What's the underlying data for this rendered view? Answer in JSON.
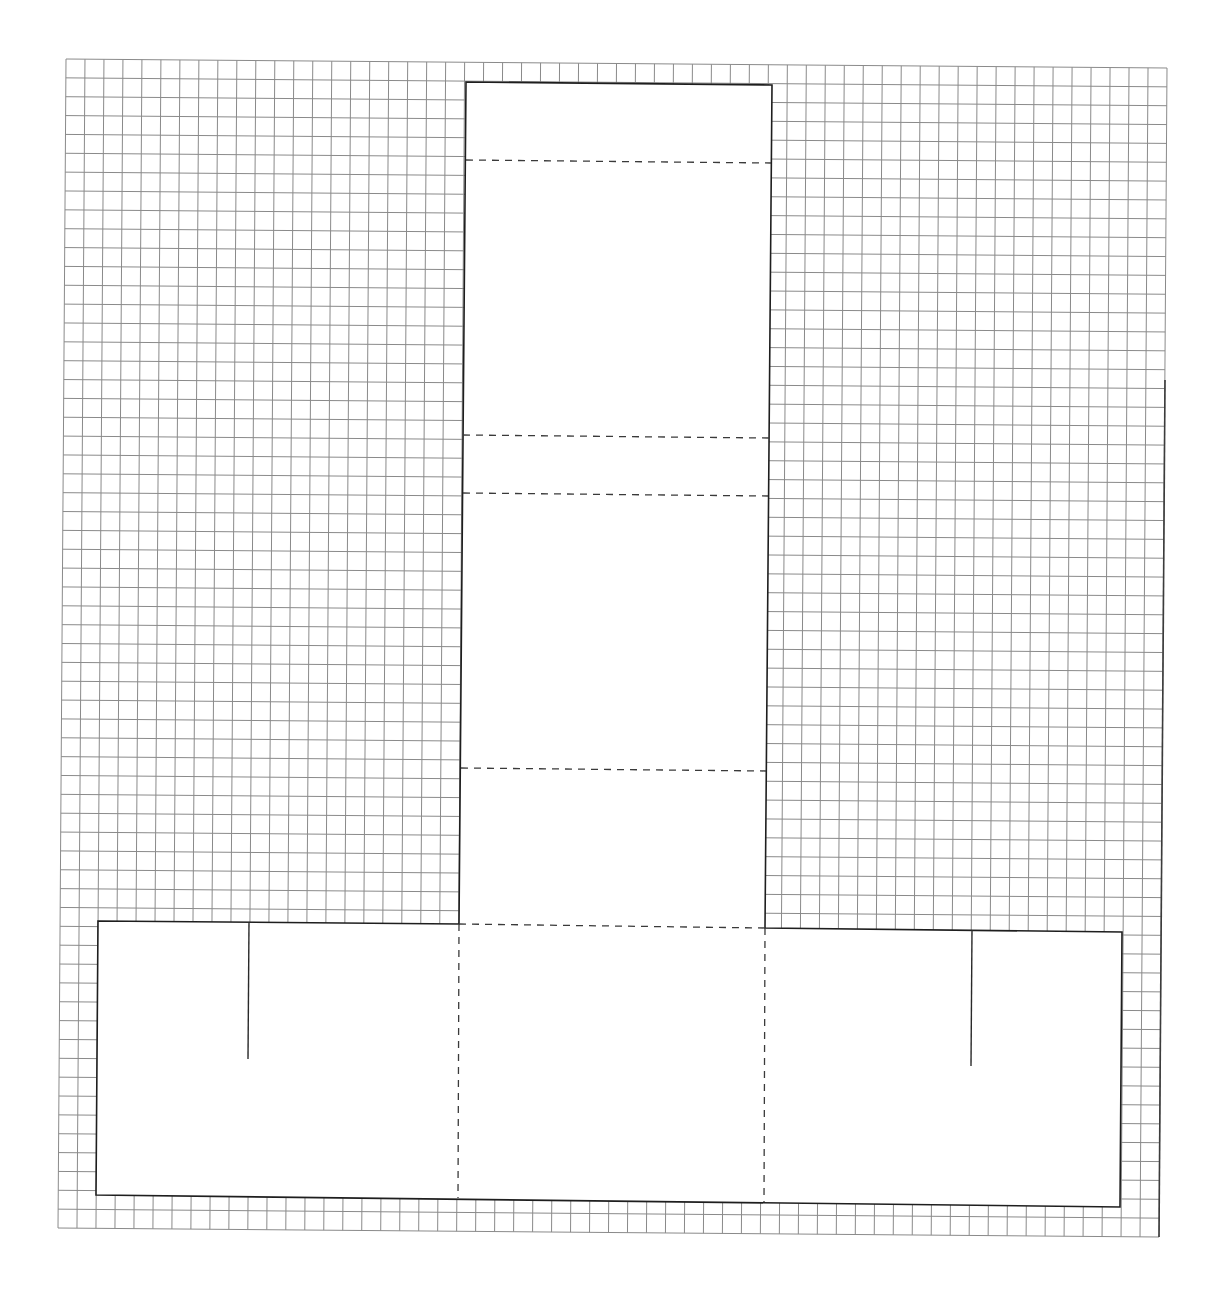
{
  "diagram": {
    "type": "box-net-template-on-graph-paper",
    "colors": {
      "background": "#ffffff",
      "grid": "#8a8a8a",
      "outline": "#1e1e1e",
      "fold_line": "#3a3a3a"
    },
    "grid": {
      "top_left": [
        66,
        59
      ],
      "top_right": [
        1167,
        68
      ],
      "bottom_left": [
        58,
        1228
      ],
      "bottom_right": [
        1159,
        1237
      ],
      "cell_size": 19
    },
    "central_panel": {
      "corners": {
        "top_left": [
          466,
          82
        ],
        "top_right": [
          772,
          85
        ],
        "bottom_left": [
          459,
          924
        ],
        "bottom_right": [
          765,
          928
        ]
      },
      "fold_lines_y": [
        {
          "left": [
            466,
            160
          ],
          "right": [
            771,
            163
          ]
        },
        {
          "left": [
            463,
            435
          ],
          "right": [
            769,
            438
          ]
        },
        {
          "left": [
            463,
            493
          ],
          "right": [
            768,
            496
          ]
        },
        {
          "left": [
            461,
            768
          ],
          "right": [
            766,
            771
          ]
        }
      ]
    },
    "base_panel": {
      "corners": {
        "top_left": [
          98,
          921
        ],
        "top_right": [
          1122,
          932
        ],
        "bottom_left": [
          96,
          1195
        ],
        "bottom_right": [
          1120,
          1207
        ]
      },
      "vertical_fold_lines": [
        {
          "top": [
            459,
            924
          ],
          "bottom": [
            458,
            1198
          ]
        },
        {
          "top": [
            765,
            928
          ],
          "bottom": [
            764,
            1202
          ]
        }
      ],
      "cut_slits": [
        {
          "top": [
            249,
            922
          ],
          "bottom": [
            248,
            1059
          ]
        },
        {
          "top": [
            972,
            930
          ],
          "bottom": [
            971,
            1066
          ]
        }
      ]
    }
  }
}
